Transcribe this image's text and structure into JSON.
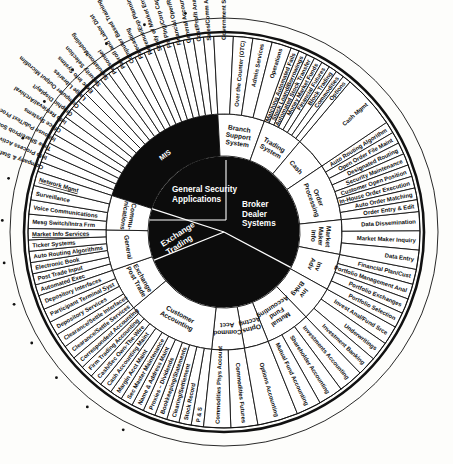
{
  "diagram": {
    "center": {
      "segments": [
        {
          "id": "gsa",
          "label": "General Security\nApplications",
          "line1": "General Security",
          "line2": "Applications"
        },
        {
          "id": "bds",
          "label": "Broker\nDealer\nSystems",
          "line1": "Broker",
          "line2": "Dealer",
          "line3": "Systems"
        },
        {
          "id": "exch",
          "label": "Exchange\nTrading",
          "line1": "Exchange",
          "line2": "Trading"
        }
      ]
    },
    "colors": {
      "ink": "#111111",
      "paper": "#ffffff",
      "core": "#0c0c0c",
      "coreText": "#ffffff"
    },
    "inner_ring": [
      {
        "id": "mis",
        "label": "MIS",
        "dark": true
      },
      {
        "id": "branch",
        "label": "Branch Support System",
        "lines": [
          "Branch",
          "Support",
          "System"
        ]
      },
      {
        "id": "trading",
        "label": "Trading System",
        "lines": [
          "Trading",
          "System"
        ]
      },
      {
        "id": "cash",
        "label": "Cash",
        "lines": [
          "Cash"
        ]
      },
      {
        "id": "orderproc",
        "label": "Order Processing",
        "lines": [
          "Order",
          "Processing"
        ]
      },
      {
        "id": "mminfo",
        "label": "Market Maker Info",
        "lines": [
          "Market",
          "Maker",
          "Info"
        ]
      },
      {
        "id": "invadv",
        "label": "Inv Adv",
        "lines": [
          "Inv",
          "Adv"
        ]
      },
      {
        "id": "invbnkg",
        "label": "Inv Bnkg",
        "lines": [
          "Inv",
          "Bnkg"
        ]
      },
      {
        "id": "mutualfund",
        "label": "Mutual Fund Accounting",
        "lines": [
          "Mutual",
          "Fund",
          "Accounting"
        ]
      },
      {
        "id": "optnsacct",
        "label": "Optns Acctng",
        "lines": [
          "Optns",
          "Acctng"
        ]
      },
      {
        "id": "commodacct",
        "label": "Commod Acct",
        "lines": [
          "Commod",
          "Acct"
        ]
      },
      {
        "id": "custacct",
        "label": "Customer Accounting",
        "lines": [
          "Customer",
          "Accounting"
        ]
      },
      {
        "id": "exchpost",
        "label": "Exchange Post Trade",
        "lines": [
          "Exchange",
          "Post Trade"
        ]
      },
      {
        "id": "general",
        "label": "General",
        "lines": [
          "General"
        ]
      },
      {
        "id": "communications",
        "label": "Communications",
        "lines": [
          "Commu-",
          "nications"
        ]
      }
    ],
    "outer_ring_groups": [
      {
        "group": "mis",
        "boxed": true,
        "items": [
          "Company & Staff Services",
          "Info Process Activities",
          "Time Share/Prob Solve",
          "Inhouse Pub/Text Proc",
          "Office Systems",
          "Info Retrieval/Archival",
          "Graphic Display/t",
          "Computer Output Microfilm",
          "Large Libraries",
          "Exec Info Systms",
          "Security Selection",
          "Simulation/Modeling",
          "Personnel",
          "Payroll and Labor Dist",
          "Computer Based Training",
          "Forecasting",
          "Revenue/Exp Planning",
          "Study of Market Environment",
          "Fin Plng/Corp Capt Mgmt",
          "Financial Oper/Report",
          "General Accounting",
          "Cost/Profit Analysis",
          "Sales/Comm Analysis"
        ]
      },
      {
        "group": "communications",
        "boxed": true,
        "items": [
          "Mesg Switch/Intra Frm",
          "Voice Communications",
          "Surveillance",
          "Network Mgmt"
        ],
        "underlined": [
          "Network Mgmt"
        ]
      },
      {
        "group": "general",
        "boxed": true,
        "items": [
          "Automated Exec",
          "Post Trade Input",
          "Electronic Book",
          "Auto Routing Algorithms",
          "Ticker Systems",
          "Market Info Services"
        ],
        "underlined": [
          "Market Info Services"
        ]
      },
      {
        "group": "exchpost",
        "items": [
          "Clearance/Settle Services",
          "Clearance/Settle Interfaces",
          "Depository Services",
          "Participant Terminal Syst",
          "Depository Interfaces"
        ]
      },
      {
        "group": "custacct",
        "items": [
          "P & S",
          "Stock Record",
          "Clearing/Settlement",
          "Bookkeeping/Statements",
          "Proxies – Dividends",
          "Name & Address Maint",
          "Sec Master Maintenance",
          "Margin Acct Maint",
          "Cash Accounting Maint",
          "Cash/Sec Own-The-Wire",
          "Firm Trading Accounting",
          "Correspondent Accounting"
        ]
      },
      {
        "group": "commodacct",
        "items": [
          "Commodities Futures",
          "Commodities Phys Account"
        ]
      },
      {
        "group": "optnsacct",
        "items": [
          "Options Accounting"
        ]
      },
      {
        "group": "mutualfund",
        "items": [
          "Investments Accounting",
          "Shareholder Accounting",
          "Mutual Fund Accounting"
        ]
      },
      {
        "group": "invbnkg",
        "items": [
          "Invest Anal/Fund Srce",
          "Underwritings",
          "Investment Banking"
        ]
      },
      {
        "group": "invadv",
        "items": [
          "Financial Plan/Cust",
          "Portfolio Management Anal",
          "Portfolio Exchanges",
          "Portfolio Selection"
        ]
      },
      {
        "group": "mminfo",
        "items": [
          "Data Dissemination",
          "Market Maker Inquiry",
          "Data Entry"
        ]
      },
      {
        "group": "orderproc",
        "items": [
          "Auto Routing Algorithm",
          "Open Order File Maint",
          "Designated Routing",
          "Security Maintenance",
          "Customer Open Position",
          "In-House Order Execution",
          "Auto Order Matching",
          "Order Entry & Edit"
        ]
      },
      {
        "group": "cash",
        "items": [
          "Cash Mgmt"
        ]
      },
      {
        "group": "trading",
        "items": [
          "Matching Automated Fails",
          "Stock Loand/Borrowings",
          "Automated Stock Transfer",
          "Money Market Funds",
          "Financial Futures",
          "Block Trading",
          "Commodities",
          "Options"
        ]
      },
      {
        "group": "branch",
        "items": [
          "Government Securities",
          "Over the Counter (OTC)",
          "Admin Services",
          "Operations"
        ]
      }
    ]
  }
}
